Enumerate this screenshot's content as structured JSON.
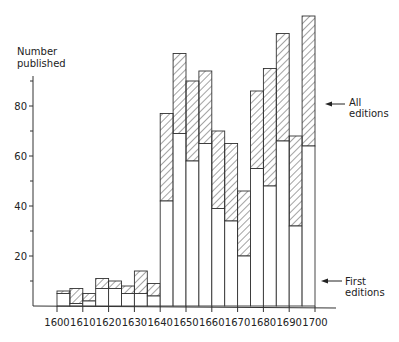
{
  "chart_data": {
    "type": "bar",
    "subtype": "overlaid histogram (first editions vs all editions)",
    "title": "",
    "ylabel": "Number published",
    "xlabel": "",
    "x_tick_labels": [
      "1600",
      "1610",
      "1620",
      "1630",
      "1640",
      "1650",
      "1660",
      "1670",
      "1680",
      "1690",
      "1700"
    ],
    "y_tick_labels": [
      "20",
      "40",
      "60",
      "80"
    ],
    "y_minor_ticks": [
      10,
      30,
      50,
      70,
      90
    ],
    "ylim": [
      0,
      120
    ],
    "bin_width_years": 5,
    "categories": [
      "1600",
      "1605",
      "1610",
      "1615",
      "1620",
      "1625",
      "1630",
      "1635",
      "1640",
      "1645",
      "1650",
      "1655",
      "1660",
      "1665",
      "1670",
      "1675",
      "1680",
      "1685",
      "1690",
      "1695"
    ],
    "series": [
      {
        "name": "All editions",
        "style": "hatched",
        "values": [
          6,
          7,
          5,
          11,
          10,
          8,
          14,
          9,
          77,
          101,
          90,
          94,
          70,
          65,
          46,
          86,
          95,
          109,
          68,
          116
        ]
      },
      {
        "name": "First editions",
        "style": "open",
        "values": [
          5,
          1,
          2,
          7,
          7,
          5,
          5,
          4,
          42,
          69,
          58,
          65,
          39,
          34,
          20,
          55,
          48,
          66,
          32,
          64
        ]
      }
    ],
    "annotations": [
      {
        "text": [
          "All",
          "editions"
        ],
        "points_to": "hatched portion"
      },
      {
        "text": [
          "First",
          "editions"
        ],
        "points_to": "open portion"
      }
    ],
    "grid": false,
    "legend": "inline arrows at right"
  }
}
